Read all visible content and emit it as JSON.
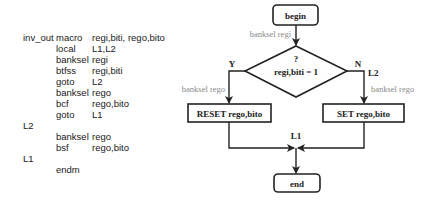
{
  "code": {
    "lines": [
      {
        "label": "inv_out",
        "op": "macro",
        "args": "regi,biti, rego,bito"
      },
      {
        "label": "",
        "op": "local",
        "args": "L1,L2"
      },
      {
        "label": "",
        "op": "banksel",
        "args": "regi"
      },
      {
        "label": "",
        "op": "btfss",
        "args": "regi,biti"
      },
      {
        "label": "",
        "op": "goto",
        "args": "L2"
      },
      {
        "label": "",
        "op": "banksel",
        "args": "rego"
      },
      {
        "label": "",
        "op": "bcf",
        "args": "rego,bito"
      },
      {
        "label": "",
        "op": "goto",
        "args": "L1"
      },
      {
        "label": "L2",
        "op": "",
        "args": ""
      },
      {
        "label": "",
        "op": "banksel",
        "args": "rego"
      },
      {
        "label": "",
        "op": "bsf",
        "args": "rego,bito"
      },
      {
        "label": "L1",
        "op": "",
        "args": ""
      },
      {
        "label": "",
        "op": "endm",
        "args": ""
      }
    ]
  },
  "flowchart": {
    "begin": "begin",
    "banksel_regi": "banksel regi",
    "decision_q": "?",
    "decision_cond": "regi,biti  = 1",
    "yes_label": "Y",
    "no_label": "N",
    "l2_label": "L2",
    "banksel_rego_left": "banksel rego",
    "banksel_rego_right": "banksel rego",
    "reset_box": "RESET rego,bito",
    "set_box": "SET rego,bito",
    "l1_label": "L1",
    "end": "end"
  }
}
